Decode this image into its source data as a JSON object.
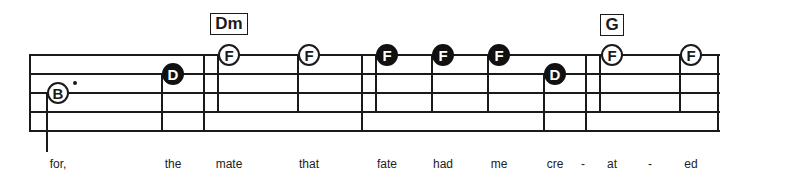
{
  "colors": {
    "ink": "#1a1a1a",
    "paper": "#ffffff"
  },
  "staff": {
    "left": 30,
    "right": 720,
    "lines_y": [
      55,
      74,
      93,
      112,
      131
    ]
  },
  "barlines": [
    {
      "x": 30,
      "top": 55,
      "bottom": 131
    },
    {
      "x": 204,
      "top": 55,
      "bottom": 131
    },
    {
      "x": 362,
      "top": 55,
      "bottom": 131
    },
    {
      "x": 586,
      "top": 55,
      "bottom": 131
    },
    {
      "x": 718,
      "top": 55,
      "bottom": 131
    }
  ],
  "chords": [
    {
      "label": "Dm",
      "x": 210,
      "y": 13,
      "w": 38,
      "h": 22
    },
    {
      "label": "G",
      "x": 600,
      "y": 14,
      "w": 24,
      "h": 22
    }
  ],
  "notes": [
    {
      "letter": "B",
      "x": 58,
      "y": 93,
      "style": "open",
      "stem_x": 47,
      "stem_top": 93,
      "stem_bottom": 152,
      "dotted": true,
      "dot_x": 75,
      "dot_y": 83
    },
    {
      "letter": "D",
      "x": 173,
      "y": 74,
      "style": "filled",
      "stem_x": 162,
      "stem_top": 74,
      "stem_bottom": 131
    },
    {
      "letter": "F",
      "x": 229,
      "y": 55,
      "style": "open",
      "stem_x": 218,
      "stem_top": 55,
      "stem_bottom": 112
    },
    {
      "letter": "F",
      "x": 309,
      "y": 55,
      "style": "open",
      "stem_x": 298,
      "stem_top": 55,
      "stem_bottom": 112
    },
    {
      "letter": "F",
      "x": 387,
      "y": 55,
      "style": "filled",
      "stem_x": 376,
      "stem_top": 55,
      "stem_bottom": 112
    },
    {
      "letter": "F",
      "x": 443,
      "y": 55,
      "style": "filled",
      "stem_x": 432,
      "stem_top": 55,
      "stem_bottom": 112
    },
    {
      "letter": "F",
      "x": 499,
      "y": 55,
      "style": "filled",
      "stem_x": 488,
      "stem_top": 55,
      "stem_bottom": 112
    },
    {
      "letter": "D",
      "x": 555,
      "y": 74,
      "style": "filled",
      "stem_x": 544,
      "stem_top": 74,
      "stem_bottom": 131
    },
    {
      "letter": "F",
      "x": 612,
      "y": 55,
      "style": "open",
      "stem_x": 600,
      "stem_top": 55,
      "stem_bottom": 112
    },
    {
      "letter": "F",
      "x": 691,
      "y": 55,
      "style": "open",
      "stem_x": 680,
      "stem_top": 55,
      "stem_bottom": 112
    }
  ],
  "lyrics": [
    {
      "text": "for,",
      "x": 58
    },
    {
      "text": "the",
      "x": 173
    },
    {
      "text": "mate",
      "x": 229
    },
    {
      "text": "that",
      "x": 309
    },
    {
      "text": "fate",
      "x": 387
    },
    {
      "text": "had",
      "x": 443
    },
    {
      "text": "me",
      "x": 499
    },
    {
      "text": "cre",
      "x": 555
    },
    {
      "text": "-",
      "x": 583
    },
    {
      "text": "at",
      "x": 612
    },
    {
      "text": "-",
      "x": 650
    },
    {
      "text": "ed",
      "x": 691
    }
  ],
  "lyrics_y": 157
}
